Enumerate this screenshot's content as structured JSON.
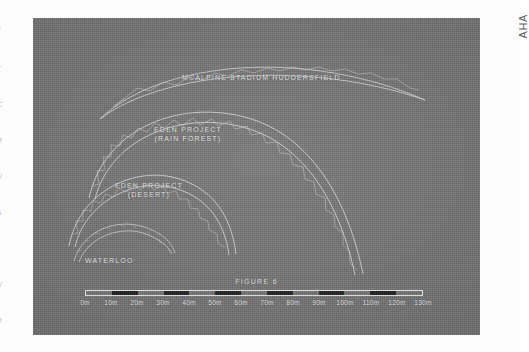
{
  "margin": {
    "side_note": "AHA",
    "bleed_glyphs": [
      "f",
      "r",
      "c",
      "e",
      "v",
      "s",
      "i",
      "v",
      "e"
    ]
  },
  "plate": {
    "figure_caption": "FIGURE 6",
    "background_color": "#6f6f6f",
    "line_color": "#e8e8e8"
  },
  "labels": {
    "mcalpine": "MCALPINE STADIUM HUDDERSFIELD",
    "eden_rain_forest": "EDEN PROJECT\n(RAIN FOREST)",
    "eden_desert": "EDEN PROJECT\n(DESERT)",
    "waterloo": "WATERLOO"
  },
  "chart_data": {
    "type": "line",
    "title": "FIGURE 6",
    "subtitle": "Comparison of arch spans and rises drawn to a common scale",
    "xlabel": "Span (metres)",
    "ylabel": "Rise (metres)",
    "xlim": [
      0,
      130
    ],
    "grid": false,
    "legend_position": "inline-annotations",
    "scale_bar": {
      "units": "m",
      "min": 0,
      "max": 130,
      "step": 10,
      "tick_labels": [
        "0m",
        "10m",
        "20m",
        "30m",
        "40m",
        "50m",
        "60m",
        "70m",
        "80m",
        "90m",
        "100m",
        "110m",
        "120m",
        "130m"
      ],
      "segment_pattern": [
        "light",
        "dark",
        "light",
        "dark",
        "light",
        "dark",
        "light",
        "dark",
        "light",
        "dark",
        "light",
        "dark",
        "light"
      ]
    },
    "series": [
      {
        "name": "MCALPINE STADIUM HUDDERSFIELD",
        "structure": "shallow triangulated lattice truss arch",
        "span_m": 125,
        "rise_m": 18,
        "springing_x_m": [
          1,
          126
        ],
        "label_anchor_m": [
          44,
          95
        ]
      },
      {
        "name": "EDEN PROJECT (RAIN FOREST)",
        "structure": "triangulated truss arch",
        "span_m": 105,
        "rise_m": 55,
        "springing_x_m": [
          0,
          105
        ],
        "label_anchor_m": [
          26,
          62
        ]
      },
      {
        "name": "EDEN PROJECT (DESERT)",
        "structure": "triangulated truss arch",
        "span_m": 56,
        "rise_m": 34,
        "springing_x_m": [
          0,
          56
        ],
        "label_anchor_m": [
          10,
          36
        ]
      },
      {
        "name": "WATERLOO",
        "structure": "slender two-chord arch rib",
        "span_m": 35,
        "rise_m": 14,
        "springing_x_m": [
          0,
          35
        ],
        "label_anchor_m": [
          3,
          8
        ]
      }
    ]
  }
}
